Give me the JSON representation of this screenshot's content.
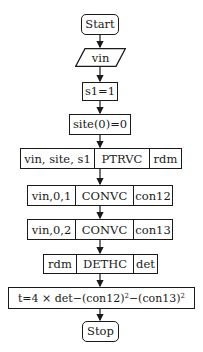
{
  "flowchart": {
    "start": "Start",
    "input": "vin",
    "init_s1": "s1=1",
    "init_site": "site(0)=0",
    "ptrvc": {
      "inputs": "vin, site, s1",
      "proc": "PTRVC",
      "output": "rdm"
    },
    "convc1": {
      "inputs": "vin,0,1",
      "proc": "CONVC",
      "output": "con12"
    },
    "convc2": {
      "inputs": "vin,0,2",
      "proc": "CONVC",
      "output": "con13"
    },
    "dethc": {
      "inputs": "rdm",
      "proc": "DETHC",
      "output": "det"
    },
    "formula": {
      "prefix": "t=4 × det−(con12)",
      "exp1": "2",
      "mid": "−(con13)",
      "exp2": "2"
    },
    "stop": "Stop"
  },
  "colors": {
    "stroke": "#1a1a1a",
    "background": "#ffffff"
  }
}
